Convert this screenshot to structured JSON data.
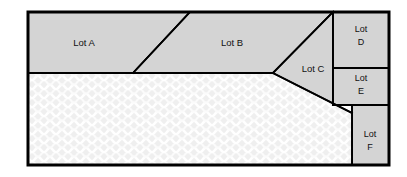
{
  "diagram": {
    "canvas": {
      "width": 407,
      "height": 177
    },
    "colors": {
      "background": "#ffffff",
      "lot_fill": "#d4d4d4",
      "water_fill": "#efefef",
      "water_wave": "#ffffff",
      "outline": "#000000"
    },
    "outer_boundary": {
      "x": 28,
      "y": 12,
      "width": 361,
      "height": 153,
      "stroke_width": 3
    },
    "lots": [
      {
        "id": "lot-a",
        "label": "Lot A",
        "label_x": 84,
        "label_y": 42,
        "points": "28,12 190,12 133,73 28,73"
      },
      {
        "id": "lot-b",
        "label": "Lot B",
        "label_x": 232,
        "label_y": 42,
        "points": "190,12 333,12 273,73 133,73"
      },
      {
        "id": "lot-c",
        "label": "Lot C",
        "label_x": 312,
        "label_y": 68,
        "points": "333,12 333,117 273,73"
      },
      {
        "id": "lot-d",
        "label_line1": "Lot",
        "label_line2": "D",
        "label_x": 361,
        "label_y": 34,
        "points": "333,12 389,12 389,68 333,68"
      },
      {
        "id": "lot-e",
        "label_line1": "Lot",
        "label_line2": "E",
        "label_x": 361,
        "label_y": 81,
        "points": "333,68 389,68 389,105 333,105"
      },
      {
        "id": "lot-f",
        "label_line1": "Lot",
        "label_line2": "F",
        "label_x": 370,
        "label_y": 140,
        "points": "352,105 389,105 389,165 352,165"
      }
    ],
    "water": {
      "id": "water-region",
      "label": "water",
      "points": "28,73 273,73 352,113 352,165 28,165"
    },
    "interior_lines": [
      {
        "id": "line-upper-strip-base",
        "x1": 28,
        "y1": 73,
        "x2": 273,
        "y2": 73
      },
      {
        "id": "line-a-b-divider",
        "x1": 133,
        "y1": 73,
        "x2": 190,
        "y2": 12
      },
      {
        "id": "line-b-c-divider",
        "x1": 273,
        "y1": 73,
        "x2": 333,
        "y2": 12
      },
      {
        "id": "line-c-water-divider",
        "x1": 273,
        "y1": 73,
        "x2": 352,
        "y2": 113
      },
      {
        "id": "line-def-column",
        "x1": 333,
        "y1": 12,
        "x2": 333,
        "y2": 105
      },
      {
        "id": "line-d-e-divider",
        "x1": 333,
        "y1": 68,
        "x2": 389,
        "y2": 68
      },
      {
        "id": "line-e-f-divider",
        "x1": 333,
        "y1": 105,
        "x2": 389,
        "y2": 105
      },
      {
        "id": "line-f-left-edge",
        "x1": 352,
        "y1": 105,
        "x2": 352,
        "y2": 165
      }
    ]
  }
}
